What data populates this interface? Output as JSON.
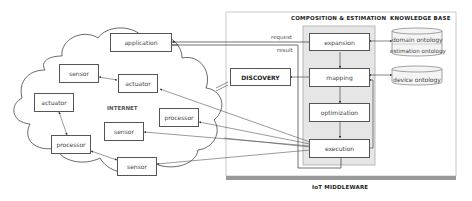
{
  "internet": {
    "label": "INTERNET",
    "nodes": [
      {
        "id": "application",
        "label": "application"
      },
      {
        "id": "sensor1",
        "label": "sensor"
      },
      {
        "id": "actuator1",
        "label": "actuator"
      },
      {
        "id": "actuator2",
        "label": "actuator"
      },
      {
        "id": "processor1",
        "label": "processor"
      },
      {
        "id": "sensor2",
        "label": "sensor"
      },
      {
        "id": "processor2",
        "label": "processor"
      },
      {
        "id": "sensor3",
        "label": "sensor"
      }
    ]
  },
  "middleware": {
    "label": "IoT MIDDLEWARE",
    "discovery": "DISCOVERY",
    "composition_title": "COMPOSITION & ESTIMATION",
    "knowledge_base_title": "KNOWLEDGE BASE",
    "request_label": "request",
    "result_label": "result",
    "steps": [
      {
        "id": "expansion",
        "label": "expansion"
      },
      {
        "id": "mapping",
        "label": "mapping"
      },
      {
        "id": "optimization",
        "label": "optimization"
      },
      {
        "id": "execution",
        "label": "execution"
      }
    ],
    "knowledge_base": [
      {
        "id": "domain-estimation",
        "labels": [
          "domain ontology",
          "estimation ontology"
        ]
      },
      {
        "id": "device",
        "labels": [
          "device ontology"
        ]
      }
    ]
  }
}
